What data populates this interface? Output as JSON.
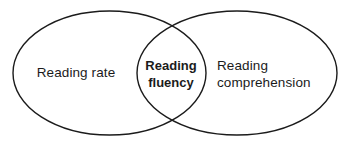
{
  "diagram": {
    "type": "venn",
    "background_color": "#ffffff",
    "stroke_color": "#1b1b1b",
    "stroke_width": 1.4,
    "sets": [
      {
        "id": "left",
        "label": "Reading rate",
        "bold": false,
        "ellipse": {
          "cx": 109.5,
          "cy": 73,
          "rx": 96.5,
          "ry": 62
        }
      },
      {
        "id": "right",
        "label": "Reading\ncomprehension",
        "bold": false,
        "ellipse": {
          "cx": 237,
          "cy": 73,
          "rx": 100,
          "ry": 62
        }
      }
    ],
    "intersection": {
      "id": "center",
      "label": "Reading\nfluency",
      "bold": true
    }
  }
}
